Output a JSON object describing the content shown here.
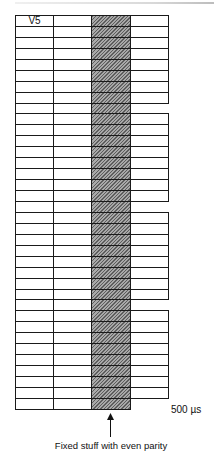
{
  "diagram": {
    "type": "frame-structure",
    "rows": 36,
    "row_pitch_px": 10.94,
    "columns": [
      {
        "index": 0,
        "name": "column-1",
        "hatched": false,
        "x": 0,
        "width": 38
      },
      {
        "index": 1,
        "name": "column-2",
        "hatched": false,
        "x": 38,
        "width": 38
      },
      {
        "index": 2,
        "name": "column-fixed-stuff",
        "hatched": true,
        "x": 76,
        "width": 39
      },
      {
        "index": 3,
        "name": "column-4",
        "hatched": false,
        "x": 115,
        "width": 38
      }
    ],
    "missing_cells_column_4_rows": [
      8,
      17,
      26,
      35
    ],
    "first_cell_label": "V5",
    "duration_label": "500 µs",
    "caption": "Fixed stuff with even parity",
    "colors": {
      "line": "#1a1a1a",
      "hatch_dark": "#5e5e5e",
      "hatch_light": "#a9a9a9",
      "background": "#ffffff"
    }
  }
}
